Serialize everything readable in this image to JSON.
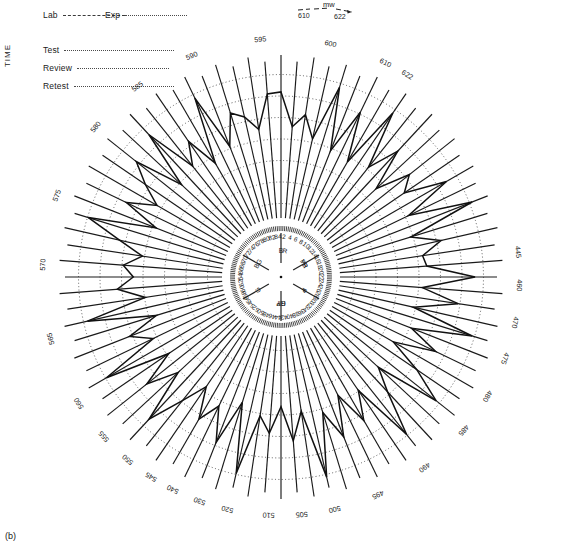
{
  "panel": {
    "tag": "(b)"
  },
  "axis": {
    "vertical_label": "TIME"
  },
  "legend": {
    "top": [
      {
        "name": "lab",
        "label": "Lab",
        "style": "dashed",
        "line_px": 62
      },
      {
        "name": "exp",
        "label": "Exp",
        "style": "dotted",
        "line_px": 62
      }
    ],
    "rows": [
      {
        "name": "test",
        "label": "Test",
        "style": "dotted",
        "line_px": 110
      },
      {
        "name": "review",
        "label": "Review",
        "style": "dotted",
        "line_px": 92
      },
      {
        "name": "retest",
        "label": "Retest",
        "style": "dotted",
        "line_px": 100
      }
    ]
  },
  "annotation": {
    "title": "mw",
    "left_value": "610",
    "right_value": "622"
  },
  "chart_data": {
    "type": "line",
    "coordinate_system": "polar",
    "title": "",
    "subtitle": "",
    "xlabel": "",
    "ylabel": "",
    "grid": true,
    "legend_position": "top-left",
    "radial_rings": 7,
    "spoke_count": 84,
    "inner_radius_px": 52,
    "outer_radius_px": 210,
    "center_px": [
      281,
      277
    ],
    "spoke_numbers": [
      2,
      4,
      6,
      8,
      10,
      12,
      14,
      16,
      18,
      20,
      22,
      24,
      26,
      28,
      30,
      32,
      34,
      36,
      38,
      40,
      42,
      44,
      46,
      48,
      50,
      52,
      54,
      56,
      58,
      60,
      62,
      64,
      66,
      68,
      70,
      72,
      74,
      76,
      78,
      80,
      82,
      84
    ],
    "hue_labels": [
      {
        "text": "R",
        "spoke": 1
      },
      {
        "text": "YR",
        "spoke": 7
      },
      {
        "text": "Y",
        "spoke": 14
      },
      {
        "text": "GY",
        "spoke": 21
      },
      {
        "text": "G",
        "spoke": 28
      },
      {
        "text": "BG",
        "spoke": 35
      },
      {
        "text": "B",
        "spoke": 42
      },
      {
        "text": "PB",
        "spoke": 49
      },
      {
        "text": "P",
        "spoke": 56
      },
      {
        "text": "RP",
        "spoke": 63
      }
    ],
    "wavelength_labels": [
      {
        "text": "600",
        "angle_deg": -78
      },
      {
        "text": "595",
        "angle_deg": -95
      },
      {
        "text": "590",
        "angle_deg": -112
      },
      {
        "text": "585",
        "angle_deg": -127
      },
      {
        "text": "580",
        "angle_deg": -141
      },
      {
        "text": "575",
        "angle_deg": -160
      },
      {
        "text": "570",
        "angle_deg": -177
      },
      {
        "text": "565",
        "angle_deg": 165
      },
      {
        "text": "560",
        "angle_deg": 148
      },
      {
        "text": "555",
        "angle_deg": 138
      },
      {
        "text": "550",
        "angle_deg": 130
      },
      {
        "text": "545",
        "angle_deg": 123
      },
      {
        "text": "540",
        "angle_deg": 117
      },
      {
        "text": "530",
        "angle_deg": 110
      },
      {
        "text": "520",
        "angle_deg": 103
      },
      {
        "text": "510",
        "angle_deg": 93
      },
      {
        "text": "505",
        "angle_deg": 85
      },
      {
        "text": "500",
        "angle_deg": 77
      },
      {
        "text": "495",
        "angle_deg": 66
      },
      {
        "text": "490",
        "angle_deg": 53
      },
      {
        "text": "485",
        "angle_deg": 40
      },
      {
        "text": "480",
        "angle_deg": 30
      },
      {
        "text": "475",
        "angle_deg": 20
      },
      {
        "text": "470",
        "angle_deg": 11
      },
      {
        "text": "460",
        "angle_deg": 2
      },
      {
        "text": "445",
        "angle_deg": -6
      },
      {
        "text": "610",
        "angle_deg": -64
      },
      {
        "text": "622",
        "angle_deg": -58
      }
    ],
    "series": [
      {
        "name": "saturation-locus",
        "style": "solid",
        "values": [
          178,
          132,
          150,
          120,
          196,
          112,
          175,
          108,
          196,
          118,
          160,
          104,
          150,
          130,
          186,
          120,
          205,
          112,
          150,
          122,
          126,
          190,
          120,
          170,
          112,
          198,
          118,
          160,
          104,
          150,
          196,
          108,
          140,
          200,
          114,
          152,
          106,
          160,
          120,
          205,
          112,
          150,
          104,
          140,
          118,
          200,
          106,
          168,
          122,
          150,
          108,
          142,
          190,
          118,
          160,
          112,
          200,
          120,
          148,
          105,
          196,
          114,
          150,
          128,
          142,
          118,
          152,
          200,
          110,
          160,
          122,
          150,
          178,
          112,
          190,
          120,
          150,
          106,
          196,
          118,
          160,
          150,
          130,
          176
        ]
      }
    ]
  }
}
